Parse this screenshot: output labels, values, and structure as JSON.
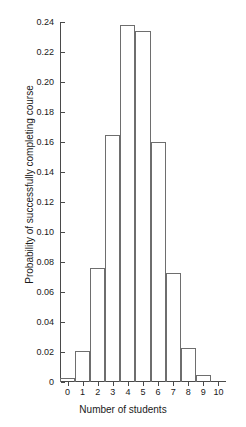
{
  "chart_data": {
    "type": "bar",
    "title": "",
    "subtitle": "",
    "xlabel": "Number of students",
    "ylabel": "Probability of successfully completing course",
    "categories": [
      "0",
      "1",
      "2",
      "3",
      "4",
      "5",
      "6",
      "7",
      "8",
      "9",
      "10"
    ],
    "values": [
      0.003,
      0.021,
      0.076,
      0.165,
      0.238,
      0.234,
      0.16,
      0.073,
      0.023,
      0.005,
      0.0
    ],
    "xlim": [
      -0.5,
      10.5
    ],
    "ylim": [
      0,
      0.24
    ],
    "x_tick_labels": [
      "0",
      "1",
      "2",
      "3",
      "4",
      "5",
      "6",
      "7",
      "8",
      "9",
      "10"
    ],
    "x_tick_values": [
      0,
      1,
      2,
      3,
      4,
      5,
      6,
      7,
      8,
      9,
      10
    ],
    "y_tick_labels": [
      "0",
      "0.02",
      "0.04",
      "0.06",
      "0.08",
      "0.10",
      "0.12",
      "0.14",
      "0.16",
      "0.18",
      "0.20",
      "0.22",
      "0.24"
    ],
    "y_tick_values": [
      0,
      0.02,
      0.04,
      0.06,
      0.08,
      0.1,
      0.12,
      0.14,
      0.16,
      0.18,
      0.2,
      0.22,
      0.24
    ],
    "grid": false,
    "legend": false,
    "legend_position": "none",
    "bar_width": 1.0,
    "bar_fill": "none",
    "bar_edge_color": "#6e6e6e",
    "axis_color": "#4a4a4a",
    "text_color": "#1a1a1a",
    "background_color": "#ffffff"
  }
}
